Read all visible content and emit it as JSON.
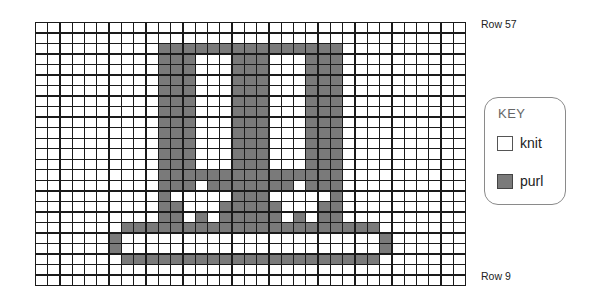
{
  "labels": {
    "top_row": "Row 57",
    "bottom_row": "Row 9"
  },
  "key": {
    "title": "KEY",
    "items": [
      {
        "symbol": "knit",
        "label": "knit",
        "color": "#ffffff"
      },
      {
        "symbol": "purl",
        "label": "purl",
        "color": "#7a7a7a"
      }
    ]
  },
  "chart": {
    "columns": 35,
    "rows": 25,
    "legend": ". = knit, P = purl",
    "grid": [
      "...................................",
      "...................................",
      "..........PPPPPPPPPPPPPPP..........",
      "..........PPP...PPP...PPP..........",
      "..........PPP...PPP...PPP..........",
      "..........PPP...PPP...PPP..........",
      "..........PPP...PPP...PPP..........",
      "..........PPP...PPP...PPP..........",
      "..........PPP...PPP...PPP..........",
      "..........PPP...PPP...PPP..........",
      "..........PPP...PPP...PPP..........",
      "..........PPP...PPP...PPP..........",
      "..........PPP...PPP...PPP..........",
      "..........PPP...PPP...PPP..........",
      "..........PPPPPPPPPPPPPPP..........",
      "..........PPP.PPPPPPP.PPP..........",
      "..........P.....PPP.....P..........",
      "..........PP...PPPPP...PP..........",
      "..........PP.P.PPPPP.P.PP..........",
      ".......PPPPPPPPPPPPPPPPPPPPP.......",
      "......P.....................P......",
      "......P.....................P......",
      ".......PPPPPPPPPPPPPPPPPPPPP.......",
      "...................................",
      "..................................."
    ]
  }
}
